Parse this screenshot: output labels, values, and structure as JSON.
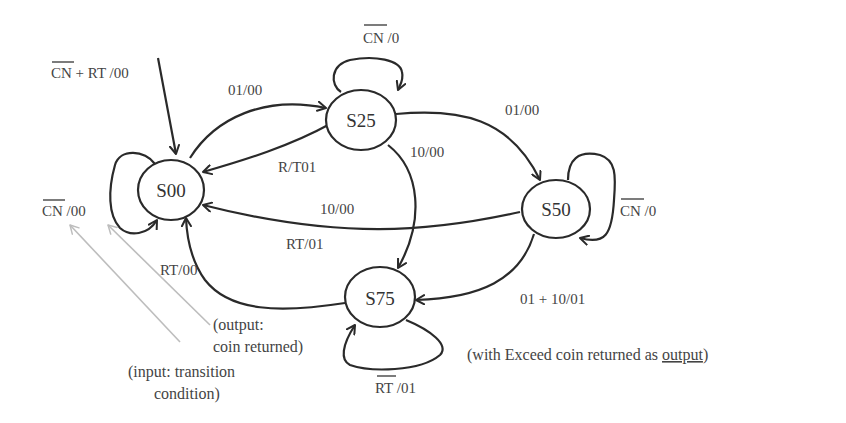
{
  "diagram": {
    "type": "finite-state-machine",
    "colors": {
      "line": "#2a2a2a",
      "text": "#444444",
      "pointer": "#bdbdbd",
      "background": "#ffffff"
    },
    "states": [
      {
        "id": "S00",
        "label": "S00"
      },
      {
        "id": "S25",
        "label": "S25"
      },
      {
        "id": "S50",
        "label": "S50"
      },
      {
        "id": "S75",
        "label": "S75"
      }
    ],
    "initial": {
      "to": "S00",
      "label_overbar": "CN",
      "label_rest": " + RT /00"
    },
    "transitions": [
      {
        "from": "S00",
        "to": "S00",
        "label_overbar": "CN",
        "label_rest": " /00"
      },
      {
        "from": "S00",
        "to": "S25",
        "label": "01/00"
      },
      {
        "from": "S25",
        "to": "S25",
        "label_overbar": "CN",
        "label_rest": " /0"
      },
      {
        "from": "S25",
        "to": "S00",
        "label": "R/T01"
      },
      {
        "from": "S25",
        "to": "S50",
        "label": "01/00"
      },
      {
        "from": "S25",
        "to": "S75",
        "label": "10/00"
      },
      {
        "from": "S50",
        "to": "S50",
        "label_overbar": "CN",
        "label_rest": " /0"
      },
      {
        "from": "S50",
        "to": "S00",
        "label_a": "10/00",
        "label_b": "RT/01"
      },
      {
        "from": "S50",
        "to": "S75",
        "label": "01 + 10/01"
      },
      {
        "from": "S75",
        "to": "S00",
        "label": "RT/00"
      },
      {
        "from": "S75",
        "to": "S75",
        "label_overbar": "RT",
        "label_rest": " /01"
      }
    ],
    "annotations": {
      "output_line1": "(output:",
      "output_line2": "coin returned)",
      "input_line1": "(input: transition",
      "input_line2": "condition)",
      "caption_prefix": "(with Exceed coin returned as ",
      "caption_underlined": "output",
      "caption_suffix": ")"
    }
  }
}
